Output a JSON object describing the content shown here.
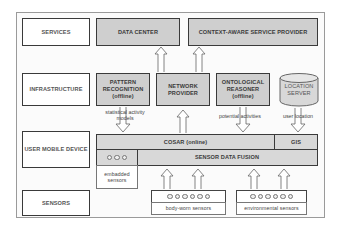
{
  "layers": {
    "services": "SERVICES",
    "infrastructure": "INFRASTRUCTURE",
    "user_mobile_device": "USER MOBILE DEVICE",
    "sensors": "SENSORS"
  },
  "services": {
    "data_center": "DATA CENTER",
    "context_aware": "CONTEXT-AWARE SERVICE PROVIDER"
  },
  "infrastructure": {
    "pattern_recognition": [
      "PATTERN",
      "RECOGNITION",
      "(offline)"
    ],
    "network_provider": [
      "NETWORK",
      "PROVIDER"
    ],
    "ontological_reasoner": [
      "ONTOLOGICAL",
      "REASONER",
      "(offline)"
    ],
    "location_server": [
      "LOCATION",
      "SERVER"
    ]
  },
  "device": {
    "cosar": "COSAR (online)",
    "gis": "GIS",
    "sensor_data_fusion": "SENSOR DATA FUSION",
    "embedded_sensors": [
      "embadded",
      "sensors"
    ]
  },
  "sensors": {
    "body_worn": "body-worn sensors",
    "environmental": "environmental sensors"
  },
  "flow_labels": {
    "statistical_models": [
      "statistical activity",
      "models"
    ],
    "potential_activities": "potential activities",
    "user_location": "user location"
  }
}
